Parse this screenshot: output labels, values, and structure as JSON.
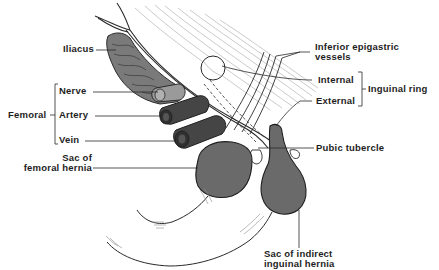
{
  "diagram": {
    "type": "anatomical-illustration",
    "colors": {
      "background": "#ffffff",
      "line": "#2a2a2a",
      "sac_fill": "#6a6a6a",
      "vessel_fill": "#454545",
      "muscle_fill": "#7a7a7a",
      "fiber_line": "#b8b8b8"
    }
  },
  "labels": {
    "iliacus": "Iliacus",
    "femoral_group": "Femoral",
    "nerve": "Nerve",
    "artery": "Artery",
    "vein": "Vein",
    "sac_femoral_line1": "Sac of",
    "sac_femoral_line2": "femoral hernia",
    "inferior_epigastric_line1": "Inferior epigastric",
    "inferior_epigastric_line2": "vessels",
    "internal": "Internal",
    "external": "External",
    "inguinal_ring": "Inguinal ring",
    "pubic_tubercle": "Pubic tubercle",
    "sac_indirect_line1": "Sac of indirect",
    "sac_indirect_line2": "inguinal hernia"
  }
}
